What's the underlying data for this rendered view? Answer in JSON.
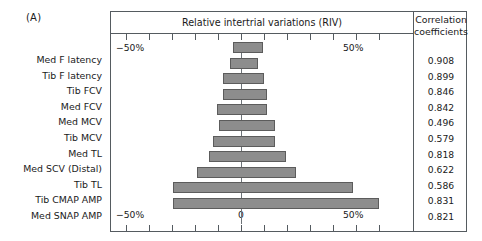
{
  "panel": {
    "letter": "(A)"
  },
  "chart": {
    "title": "Relative intertrial variations (RIV)",
    "corr_header_line1": "Correlation",
    "corr_header_line2": "coefficients",
    "axis": {
      "top_left": "−50%",
      "top_right": "50%",
      "bottom_left": "−50%",
      "bottom_zero": "0",
      "bottom_right": "50%"
    }
  },
  "chart_data": {
    "type": "bar",
    "orientation": "horizontal",
    "title": "Relative intertrial variations (RIV)",
    "xlabel": "Relative intertrial variations (RIV)",
    "ylabel": "",
    "xlim": [
      -50,
      70
    ],
    "xticks": [
      -50,
      -40,
      -30,
      -20,
      -10,
      0,
      10,
      20,
      30,
      40,
      50,
      60
    ],
    "xtick_labels": [
      "−50%",
      "",
      "",
      "",
      "",
      "0",
      "",
      "",
      "",
      "",
      "50%",
      ""
    ],
    "grid": false,
    "legend": false,
    "bar_color": "#8d8d8d",
    "bar_edge_color": "#5c5c5c",
    "zero_axis": 0,
    "categories": [
      "Med F latency",
      "Tib F latency",
      "Tib FCV",
      "Med FCV",
      "Med MCV",
      "Tib MCV",
      "Med TL",
      "Med SCV (Distal)",
      "Tib TL",
      "Tib CMAP AMP",
      "Med  SNAP AMP"
    ],
    "series": [
      {
        "name": "RIV lower bound (%)",
        "values": [
          -3.5,
          -5.0,
          -8.0,
          -8.0,
          -10.5,
          -9.5,
          -12.0,
          -14.0,
          -19.0,
          -29.5,
          -29.5
        ]
      },
      {
        "name": "RIV upper bound (%)",
        "values": [
          9.5,
          7.5,
          10.0,
          11.5,
          11.5,
          15.0,
          15.0,
          19.5,
          24.0,
          48.5,
          60.0
        ]
      },
      {
        "name": "Correlation coefficients",
        "values": [
          0.908,
          0.899,
          0.846,
          0.842,
          0.496,
          0.579,
          0.818,
          0.622,
          0.586,
          0.831,
          0.821
        ]
      }
    ],
    "correlation_coefficients_text": [
      "0.908",
      "0.899",
      "0.846",
      "0.842",
      "0.496",
      "0.579",
      "0.818",
      "0.622",
      "0.586",
      "0.831",
      "0.821"
    ]
  }
}
